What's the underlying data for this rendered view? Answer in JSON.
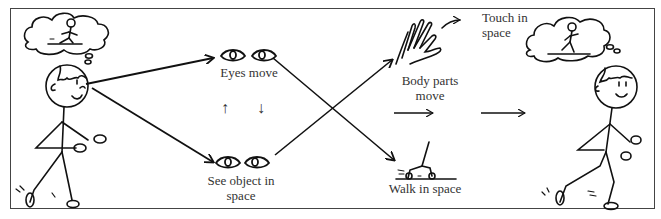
{
  "diagram": {
    "type": "flow",
    "labels": {
      "eyes_move": "Eyes move",
      "see_object_line1": "See object in",
      "see_object_line2": "space",
      "body_parts_line1": "Body parts",
      "body_parts_line2": "move",
      "touch_line1": "Touch in",
      "touch_line2": "space",
      "walk": "Walk in space"
    },
    "nodes": [
      {
        "id": "child-start",
        "kind": "stick-figure",
        "thought": "child on skateboard"
      },
      {
        "id": "eyes-move",
        "icon": "eyes-icon",
        "label": "Eyes move"
      },
      {
        "id": "see-object",
        "icon": "eyes-icon",
        "label": "See object in space"
      },
      {
        "id": "body-parts",
        "icon": "hand-icon",
        "label": "Body parts move"
      },
      {
        "id": "touch",
        "label": "Touch in space"
      },
      {
        "id": "walk",
        "icon": "foot-icon",
        "label": "Walk in space"
      },
      {
        "id": "child-end",
        "kind": "stick-figure",
        "thought": "child on skateboard"
      }
    ],
    "edges": [
      {
        "from": "child-start",
        "to": "eyes-move"
      },
      {
        "from": "child-start",
        "to": "see-object"
      },
      {
        "from": "eyes-move",
        "to": "see-object",
        "glyph": "↑ ↓"
      },
      {
        "from": "eyes-move",
        "to": "walk"
      },
      {
        "from": "see-object",
        "to": "body-parts"
      },
      {
        "from": "body-parts",
        "to": "touch"
      },
      {
        "from": "body-parts",
        "to": "child-end",
        "glyph": "→ →"
      }
    ],
    "arrows": {
      "up": "↑",
      "down": "↓"
    },
    "colors": {
      "stroke": "#111111",
      "text": "#333333",
      "border": "#444444"
    }
  }
}
